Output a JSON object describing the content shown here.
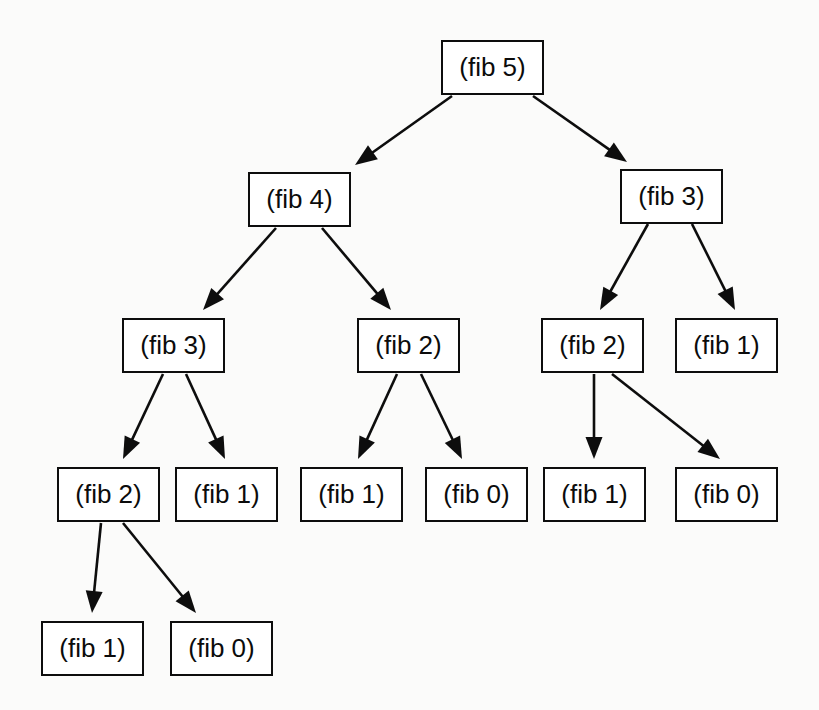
{
  "diagram": {
    "type": "tree",
    "background_color": "#fbfbfa",
    "node_fill_color": "#ffffff",
    "node_border_color": "#0d0d0d",
    "edge_color": "#0d0d0d",
    "node_width": 103,
    "node_height": 55,
    "nodes": [
      {
        "id": "n0",
        "label": "(fib 5)",
        "level": 0,
        "x": 441,
        "y": 40
      },
      {
        "id": "n1",
        "label": "(fib 4)",
        "level": 1,
        "x": 248,
        "y": 172
      },
      {
        "id": "n2",
        "label": "(fib 3)",
        "level": 1,
        "x": 620,
        "y": 169
      },
      {
        "id": "n3",
        "label": "(fib 3)",
        "level": 2,
        "x": 122,
        "y": 318
      },
      {
        "id": "n4",
        "label": "(fib 2)",
        "level": 2,
        "x": 357,
        "y": 318
      },
      {
        "id": "n5",
        "label": "(fib 2)",
        "level": 2,
        "x": 541,
        "y": 318
      },
      {
        "id": "n6",
        "label": "(fib 1)",
        "level": 2,
        "x": 675,
        "y": 318
      },
      {
        "id": "n7",
        "label": "(fib 2)",
        "level": 3,
        "x": 57,
        "y": 467
      },
      {
        "id": "n8",
        "label": "(fib 1)",
        "level": 3,
        "x": 175,
        "y": 467
      },
      {
        "id": "n9",
        "label": "(fib 1)",
        "level": 3,
        "x": 300,
        "y": 467
      },
      {
        "id": "n10",
        "label": "(fib 0)",
        "level": 3,
        "x": 425,
        "y": 467
      },
      {
        "id": "n11",
        "label": "(fib 1)",
        "level": 3,
        "x": 543,
        "y": 467
      },
      {
        "id": "n12",
        "label": "(fib 0)",
        "level": 3,
        "x": 675,
        "y": 467
      },
      {
        "id": "n13",
        "label": "(fib 1)",
        "level": 4,
        "x": 41,
        "y": 621
      },
      {
        "id": "n14",
        "label": "(fib 0)",
        "level": 4,
        "x": 170,
        "y": 621
      }
    ],
    "edges": [
      {
        "from": "n0",
        "to": "n1",
        "x1": 452,
        "y1": 96,
        "x2": 355,
        "y2": 165
      },
      {
        "from": "n0",
        "to": "n2",
        "x1": 533,
        "y1": 96,
        "x2": 627,
        "y2": 162
      },
      {
        "from": "n1",
        "to": "n3",
        "x1": 276,
        "y1": 228,
        "x2": 203,
        "y2": 310
      },
      {
        "from": "n1",
        "to": "n4",
        "x1": 322,
        "y1": 228,
        "x2": 391,
        "y2": 310
      },
      {
        "from": "n2",
        "to": "n5",
        "x1": 648,
        "y1": 224,
        "x2": 600,
        "y2": 310
      },
      {
        "from": "n2",
        "to": "n6",
        "x1": 692,
        "y1": 224,
        "x2": 735,
        "y2": 310
      },
      {
        "from": "n3",
        "to": "n7",
        "x1": 163,
        "y1": 374,
        "x2": 123,
        "y2": 459
      },
      {
        "from": "n3",
        "to": "n8",
        "x1": 186,
        "y1": 374,
        "x2": 225,
        "y2": 459
      },
      {
        "from": "n4",
        "to": "n9",
        "x1": 397,
        "y1": 374,
        "x2": 358,
        "y2": 459
      },
      {
        "from": "n4",
        "to": "n10",
        "x1": 421,
        "y1": 374,
        "x2": 462,
        "y2": 459
      },
      {
        "from": "n5",
        "to": "n11",
        "x1": 594,
        "y1": 374,
        "x2": 594,
        "y2": 459
      },
      {
        "from": "n5",
        "to": "n12",
        "x1": 612,
        "y1": 374,
        "x2": 720,
        "y2": 459
      },
      {
        "from": "n7",
        "to": "n13",
        "x1": 101,
        "y1": 523,
        "x2": 92,
        "y2": 613
      },
      {
        "from": "n7",
        "to": "n14",
        "x1": 123,
        "y1": 523,
        "x2": 196,
        "y2": 613
      }
    ]
  }
}
